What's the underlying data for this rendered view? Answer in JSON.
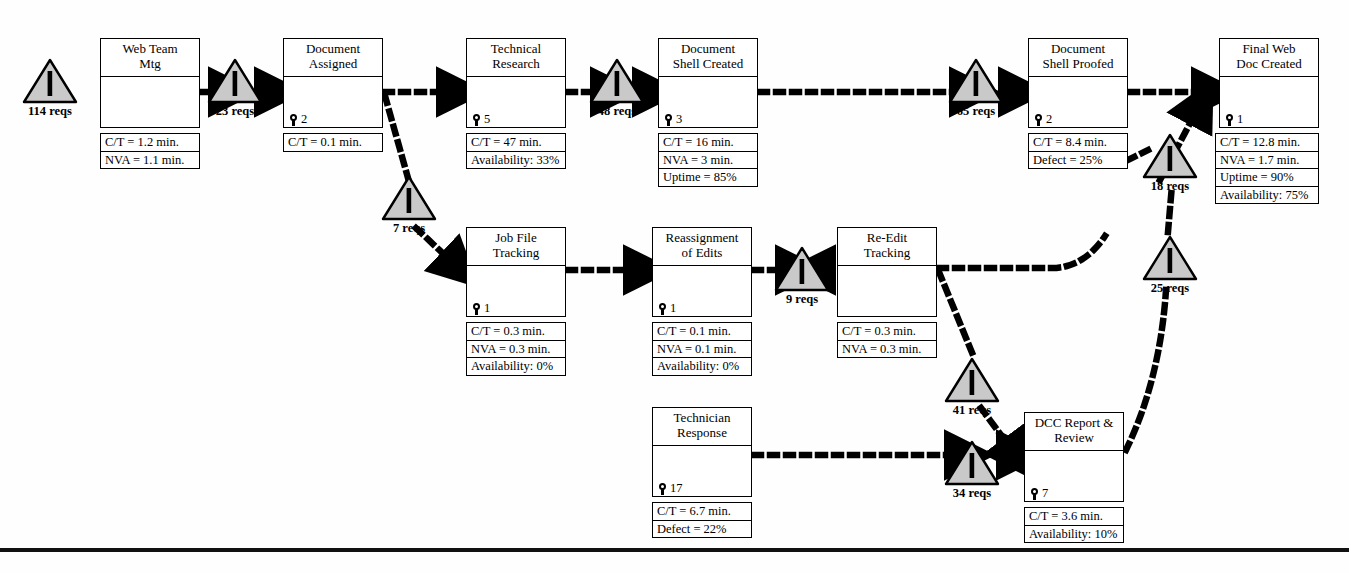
{
  "diagram": {
    "type": "value-stream-map",
    "units": {
      "inventory": "reqs",
      "time": "min."
    },
    "colors": {
      "triangle_fill": "#c9c9c9",
      "triangle_stroke": "#000000",
      "line": "#000000",
      "box_fill": "#ffffff"
    },
    "processes": [
      {
        "id": "web-team-mtg",
        "title": "Web Team\nMtg",
        "operators": null,
        "metrics": [
          "C/T = 1.2 min.",
          "NVA = 1.1 min."
        ],
        "x": 100,
        "y": 38,
        "w": 100,
        "h": 90,
        "title_h": 38,
        "data_x": 100,
        "data_y": 133,
        "data_w": 100
      },
      {
        "id": "document-assigned",
        "title": "Document\nAssigned",
        "operators": "2",
        "metrics": [
          "C/T = 0.1 min."
        ],
        "x": 283,
        "y": 38,
        "w": 100,
        "h": 90,
        "title_h": 38,
        "data_x": 283,
        "data_y": 133,
        "data_w": 100
      },
      {
        "id": "technical-research",
        "title": "Technical\nResearch",
        "operators": "5",
        "metrics": [
          "C/T = 47 min.",
          "Availability: 33%"
        ],
        "x": 466,
        "y": 38,
        "w": 100,
        "h": 90,
        "title_h": 38,
        "data_x": 466,
        "data_y": 133,
        "data_w": 100
      },
      {
        "id": "document-shell-created",
        "title": "Document\nShell Created",
        "operators": "3",
        "metrics": [
          "C/T = 16 min.",
          "NVA = 3 min.",
          "Uptime = 85%"
        ],
        "x": 658,
        "y": 38,
        "w": 100,
        "h": 90,
        "title_h": 38,
        "data_x": 658,
        "data_y": 133,
        "data_w": 100
      },
      {
        "id": "document-shell-proofed",
        "title": "Document\nShell Proofed",
        "operators": "2",
        "metrics": [
          "C/T = 8.4 min.",
          "Defect = 25%"
        ],
        "x": 1028,
        "y": 38,
        "w": 100,
        "h": 90,
        "title_h": 38,
        "data_x": 1028,
        "data_y": 133,
        "data_w": 100
      },
      {
        "id": "final-web-doc-created",
        "title": "Final Web\nDoc Created",
        "operators": "1",
        "metrics": [
          "C/T = 12.8 min.",
          "NVA = 1.7 min.",
          "Uptime = 90%",
          "Availability: 75%"
        ],
        "x": 1219,
        "y": 38,
        "w": 100,
        "h": 90,
        "title_h": 38,
        "data_x": 1215,
        "data_y": 133,
        "data_w": 104
      },
      {
        "id": "job-file-tracking",
        "title": "Job File\nTracking",
        "operators": "1",
        "metrics": [
          "C/T = 0.3 min.",
          "NVA = 0.3 min.",
          "Availability: 0%"
        ],
        "x": 466,
        "y": 227,
        "w": 100,
        "h": 90,
        "title_h": 38,
        "data_x": 466,
        "data_y": 322,
        "data_w": 100
      },
      {
        "id": "reassignment-of-edits",
        "title": "Reassignment\nof Edits",
        "operators": "1",
        "metrics": [
          "C/T = 0.1 min.",
          "NVA = 0.1 min.",
          "Availability: 0%"
        ],
        "x": 652,
        "y": 227,
        "w": 100,
        "h": 90,
        "title_h": 38,
        "data_x": 652,
        "data_y": 322,
        "data_w": 100
      },
      {
        "id": "re-edit-tracking",
        "title": "Re-Edit\nTracking",
        "operators": null,
        "metrics": [
          "C/T = 0.3 min.",
          "NVA = 0.3 min."
        ],
        "x": 837,
        "y": 227,
        "w": 100,
        "h": 90,
        "title_h": 38,
        "data_x": 837,
        "data_y": 322,
        "data_w": 100
      },
      {
        "id": "technician-response",
        "title": "Technician\nResponse",
        "operators": "17",
        "metrics": [
          "C/T = 6.7 min.",
          "Defect = 22%"
        ],
        "x": 652,
        "y": 407,
        "w": 100,
        "h": 90,
        "title_h": 38,
        "data_x": 652,
        "data_y": 502,
        "data_w": 100
      },
      {
        "id": "dcc-report-review",
        "title": "DCC Report &\nReview",
        "operators": "7",
        "metrics": [
          "C/T = 3.6 min.",
          "Availability: 10%"
        ],
        "x": 1024,
        "y": 412,
        "w": 100,
        "h": 90,
        "title_h": 38,
        "data_x": 1024,
        "data_y": 507,
        "data_w": 100
      }
    ],
    "inventories": [
      {
        "id": "inv-114",
        "label": "114 reqs",
        "x": 22,
        "y": 58
      },
      {
        "id": "inv-23",
        "label": "23 reqs",
        "x": 207,
        "y": 58
      },
      {
        "id": "inv-48",
        "label": "48 reqs",
        "x": 589,
        "y": 58
      },
      {
        "id": "inv-65",
        "label": "65 reqs",
        "x": 948,
        "y": 58
      },
      {
        "id": "inv-7",
        "label": "7 reqs",
        "x": 381,
        "y": 175
      },
      {
        "id": "inv-18",
        "label": "18 reqs",
        "x": 1142,
        "y": 133
      },
      {
        "id": "inv-9",
        "label": "9 reqs",
        "x": 774,
        "y": 246
      },
      {
        "id": "inv-25",
        "label": "25 reqs",
        "x": 1142,
        "y": 235
      },
      {
        "id": "inv-41",
        "label": "41 reqs",
        "x": 944,
        "y": 357
      },
      {
        "id": "inv-34",
        "label": "34 reqs",
        "x": 944,
        "y": 440
      }
    ],
    "flows": [
      {
        "from": "web-team-mtg",
        "to": "inv-23",
        "style": "dashed-push"
      },
      {
        "from": "inv-23",
        "to": "document-assigned",
        "style": "dashed-push"
      },
      {
        "from": "document-assigned",
        "to": "technical-research",
        "style": "dashed-push"
      },
      {
        "from": "document-assigned",
        "to": "inv-7",
        "style": "dashed-push"
      },
      {
        "from": "technical-research",
        "to": "inv-48",
        "style": "dashed-push"
      },
      {
        "from": "inv-48",
        "to": "document-shell-created",
        "style": "dashed-push"
      },
      {
        "from": "document-shell-created",
        "to": "inv-65",
        "style": "dashed-push"
      },
      {
        "from": "inv-65",
        "to": "document-shell-proofed",
        "style": "dashed-push"
      },
      {
        "from": "document-shell-proofed",
        "to": "final-web-doc-created",
        "style": "dashed-push"
      },
      {
        "from": "inv-7",
        "to": "job-file-tracking",
        "style": "dashed-push"
      },
      {
        "from": "job-file-tracking",
        "to": "reassignment-of-edits",
        "style": "dashed-push"
      },
      {
        "from": "reassignment-of-edits",
        "to": "inv-9",
        "style": "dashed-push"
      },
      {
        "from": "inv-9",
        "to": "re-edit-tracking",
        "style": "dashed-push"
      },
      {
        "from": "re-edit-tracking",
        "to": "inv-25",
        "style": "dashed-push"
      },
      {
        "from": "re-edit-tracking",
        "to": "inv-41",
        "style": "dashed-push"
      },
      {
        "from": "inv-41",
        "to": "dcc-report-review",
        "style": "dashed-push"
      },
      {
        "from": "technician-response",
        "to": "inv-34",
        "style": "dashed-push"
      },
      {
        "from": "inv-34",
        "to": "dcc-report-review",
        "style": "dashed-push"
      },
      {
        "from": "inv-25",
        "to": "inv-18",
        "style": "dashed-push"
      },
      {
        "from": "inv-18",
        "to": "final-web-doc-created",
        "style": "dashed-push"
      },
      {
        "from": "dcc-report-review",
        "to": "inv-25",
        "style": "dashed-push"
      }
    ],
    "footer_rule": {
      "x": 0,
      "y": 548,
      "w": 1349
    }
  }
}
